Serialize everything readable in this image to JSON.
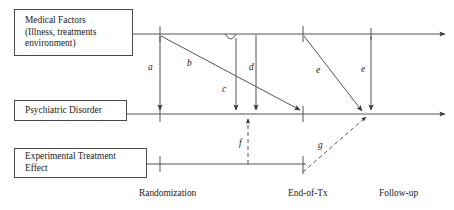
{
  "figure": {
    "type": "path-diagram"
  },
  "boxes": {
    "medical": {
      "name": "medical-factors-box",
      "lines": [
        "Medical Factors",
        "(Illness, treatments",
        "environment)"
      ]
    },
    "psychiatric": {
      "name": "psychiatric-disorder-box",
      "lines": [
        "Psychiatric Disorder"
      ]
    },
    "experimental": {
      "name": "experimental-treatment-effect-box",
      "lines": [
        "Experimental Treatment",
        "Effect"
      ]
    }
  },
  "timeline": {
    "ticks": [
      {
        "label": "Randomization",
        "x": 160
      },
      {
        "label": "End-of-Tx",
        "x": 303
      },
      {
        "label": "Follow-up",
        "x": 371
      }
    ]
  },
  "rows": {
    "medical_y": 34,
    "psychiatric_y": 114,
    "experimental_y": 164
  },
  "paths": [
    {
      "id": "a",
      "label": "a",
      "style": "solid",
      "from": "medical@randomization",
      "to": "psychiatric@randomization"
    },
    {
      "id": "b",
      "label": "b",
      "style": "solid",
      "from": "medical@randomization",
      "to": "psychiatric@pre-end-of-tx"
    },
    {
      "id": "c",
      "label": "c",
      "style": "solid",
      "from": "medical@mid",
      "to": "psychiatric@mid"
    },
    {
      "id": "d",
      "label": "d",
      "style": "solid",
      "from": "medical@mid2",
      "to": "psychiatric@mid2"
    },
    {
      "id": "e1",
      "label": "e",
      "style": "solid",
      "from": "medical@end-of-tx",
      "to": "psychiatric@follow-up"
    },
    {
      "id": "e2",
      "label": "e",
      "style": "solid",
      "from": "medical@follow-up",
      "to": "psychiatric@follow-up"
    },
    {
      "id": "f",
      "label": "f",
      "style": "dashed",
      "from": "experimental@mid",
      "to": "psychiatric@mid"
    },
    {
      "id": "g",
      "label": "g",
      "style": "dashed",
      "from": "experimental@end-of-tx",
      "to": "psychiatric@follow-up"
    }
  ],
  "colors": {
    "line": "#555555",
    "box_border": "#4a4a4a",
    "text": "#1a1a1a",
    "background": "#ffffff"
  }
}
